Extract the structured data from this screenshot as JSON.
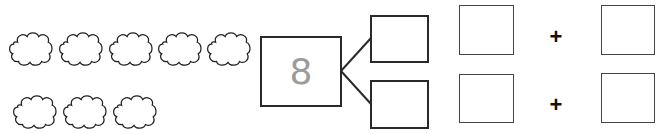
{
  "worksheet": {
    "clouds": {
      "count": 8,
      "row1_count": 5,
      "row2_count": 3
    },
    "number_bond": {
      "whole": "8",
      "part_top": "",
      "part_bottom": ""
    },
    "equations": [
      {
        "addend1": "",
        "operator": "+",
        "addend2": ""
      },
      {
        "addend1": "",
        "operator": "+",
        "addend2": ""
      }
    ]
  }
}
